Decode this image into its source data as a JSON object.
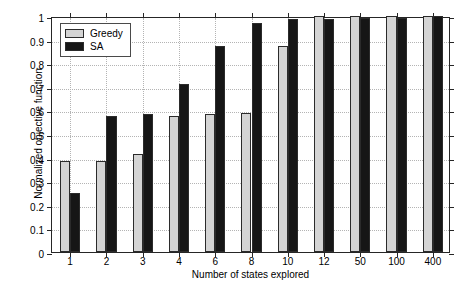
{
  "chart_data": {
    "type": "bar",
    "title": "",
    "xlabel": "Number of states explored",
    "ylabel": "Normalized objective function",
    "categories": [
      "1",
      "2",
      "3",
      "4",
      "6",
      "8",
      "10",
      "12",
      "50",
      "100",
      "400"
    ],
    "series": [
      {
        "name": "Greedy",
        "color": "#d4d4d4",
        "values": [
          0.385,
          0.387,
          0.417,
          0.577,
          0.585,
          0.59,
          0.875,
          1.0,
          1.0,
          1.0,
          1.0
        ]
      },
      {
        "name": "SA",
        "color": "#161616",
        "values": [
          0.248,
          0.578,
          0.586,
          0.714,
          0.873,
          0.97,
          0.989,
          0.988,
          0.991,
          0.991,
          1.0
        ]
      }
    ],
    "ylim": [
      0,
      1
    ],
    "yticks": [
      "0",
      "0.1",
      "0.2",
      "0.3",
      "0.4",
      "0.5",
      "0.6",
      "0.7",
      "0.8",
      "0.9",
      "1"
    ],
    "ytick_values": [
      0,
      0.1,
      0.2,
      0.3,
      0.4,
      0.5,
      0.6,
      0.7,
      0.8,
      0.9,
      1
    ],
    "grid": true,
    "legend_position": "top-left"
  }
}
